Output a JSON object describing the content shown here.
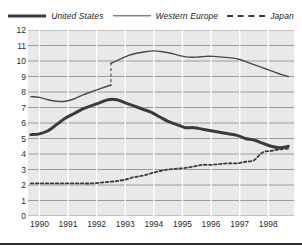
{
  "legend": {
    "position": "top-center",
    "entries": [
      {
        "label": "United States",
        "style": "thick-solid",
        "icon": "legend-line-thick-icon",
        "color": "#3b3b3b"
      },
      {
        "label": "Western Europe",
        "style": "thin-solid",
        "icon": "legend-line-thin-icon",
        "color": "#4a4a4a"
      },
      {
        "label": "Japan",
        "style": "dashed",
        "icon": "legend-line-dashed-icon",
        "color": "#3b3b3b"
      }
    ]
  },
  "chart_data": {
    "type": "line",
    "title": "",
    "subtitle": "",
    "xlabel": "",
    "ylabel": "",
    "xlim": [
      1989.6,
      1998.9
    ],
    "ylim": [
      0,
      12
    ],
    "yticks": [
      0,
      1,
      2,
      3,
      4,
      5,
      6,
      7,
      8,
      9,
      10,
      11,
      12
    ],
    "ytick_labels": [
      "0",
      "1",
      "2",
      "3",
      "4",
      "5",
      "6",
      "7",
      "8",
      "9",
      "10",
      "11",
      "12"
    ],
    "xticks": [
      1990,
      1991,
      1992,
      1993,
      1994,
      1995,
      1996,
      1997,
      1998
    ],
    "xtick_labels": [
      "1990",
      "1991",
      "1992",
      "1993",
      "1994",
      "1995",
      "1996",
      "1997",
      "1998"
    ],
    "grid": {
      "horizontal": true,
      "vertical": true,
      "horizontal_color": "#9a9a9a",
      "vertical_color": "#ffffff"
    },
    "plot_background": "#e9e9e9",
    "legend_position": "top-center",
    "annotations": [
      {
        "type": "vertical-dashed-line",
        "x": 1992.5,
        "y_from": 8.4,
        "y_to": 9.9,
        "note": "series break"
      }
    ],
    "series": [
      {
        "name": "United States",
        "style": "thick-solid",
        "color": "#3b3b3b",
        "x": [
          1989.7,
          1990.0,
          1990.3,
          1990.6,
          1990.9,
          1991.2,
          1991.5,
          1991.8,
          1992.1,
          1992.4,
          1992.7,
          1993.0,
          1993.3,
          1993.6,
          1993.9,
          1994.2,
          1994.5,
          1994.8,
          1995.1,
          1995.4,
          1995.7,
          1996.0,
          1996.3,
          1996.6,
          1996.9,
          1997.2,
          1997.5,
          1997.8,
          1998.1,
          1998.4,
          1998.7
        ],
        "y": [
          5.25,
          5.3,
          5.5,
          5.9,
          6.3,
          6.6,
          6.9,
          7.1,
          7.3,
          7.5,
          7.5,
          7.3,
          7.1,
          6.9,
          6.7,
          6.4,
          6.1,
          5.9,
          5.7,
          5.7,
          5.6,
          5.5,
          5.4,
          5.3,
          5.2,
          5.0,
          4.9,
          4.7,
          4.5,
          4.4,
          4.5
        ]
      },
      {
        "name": "Western Europe",
        "style": "thin-solid",
        "color": "#4a4a4a",
        "segments": [
          {
            "x": [
              1989.7,
              1990.0,
              1990.3,
              1990.6,
              1990.9,
              1991.2,
              1991.5,
              1991.8,
              1992.1,
              1992.5
            ],
            "y": [
              7.7,
              7.65,
              7.5,
              7.4,
              7.4,
              7.55,
              7.8,
              8.0,
              8.2,
              8.45
            ]
          },
          {
            "x": [
              1992.5,
              1992.8,
              1993.1,
              1993.4,
              1993.7,
              1994.0,
              1994.3,
              1994.6,
              1994.9,
              1995.2,
              1995.5,
              1995.8,
              1996.1,
              1996.4,
              1996.7,
              1997.0,
              1997.3,
              1997.6,
              1997.9,
              1998.2,
              1998.5,
              1998.7
            ],
            "y": [
              9.85,
              10.1,
              10.35,
              10.5,
              10.6,
              10.65,
              10.6,
              10.5,
              10.35,
              10.25,
              10.25,
              10.3,
              10.3,
              10.25,
              10.2,
              10.1,
              9.9,
              9.7,
              9.5,
              9.3,
              9.1,
              9.0
            ]
          }
        ]
      },
      {
        "name": "Japan",
        "style": "dashed",
        "color": "#3b3b3b",
        "x": [
          1989.7,
          1990.0,
          1990.3,
          1990.6,
          1990.9,
          1991.2,
          1991.5,
          1991.8,
          1992.1,
          1992.4,
          1992.7,
          1993.0,
          1993.3,
          1993.6,
          1993.9,
          1994.2,
          1994.5,
          1994.8,
          1995.1,
          1995.4,
          1995.7,
          1996.0,
          1996.3,
          1996.6,
          1996.9,
          1997.2,
          1997.5,
          1997.8,
          1998.1,
          1998.4,
          1998.7
        ],
        "y": [
          2.1,
          2.1,
          2.1,
          2.1,
          2.1,
          2.1,
          2.1,
          2.1,
          2.15,
          2.2,
          2.25,
          2.35,
          2.5,
          2.6,
          2.75,
          2.9,
          3.0,
          3.05,
          3.1,
          3.2,
          3.3,
          3.3,
          3.35,
          3.4,
          3.4,
          3.5,
          3.6,
          4.1,
          4.2,
          4.3,
          4.35
        ]
      }
    ]
  }
}
